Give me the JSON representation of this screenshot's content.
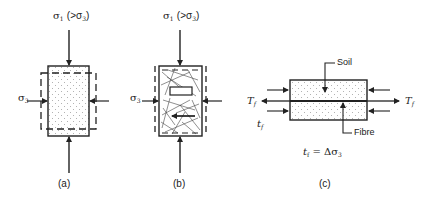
{
  "panels": {
    "a": {
      "caption": "(a)",
      "top_load_symbol": "σ",
      "top_load_sub": "1",
      "top_load_condition": "(>σ",
      "top_load_condition_sub": "3",
      "top_load_condition_close": ")",
      "side_load_symbol": "σ",
      "side_load_sub": "3"
    },
    "b": {
      "caption": "(b)",
      "top_load_symbol": "σ",
      "top_load_sub": "1",
      "top_load_condition": "(>σ",
      "top_load_condition_sub": "3",
      "top_load_condition_close": ")",
      "side_load_symbol": "σ",
      "side_load_sub": "3"
    },
    "c": {
      "caption": "(c)",
      "soil_label": "Soil",
      "fibre_label": "Fibre",
      "tension_symbol": "T",
      "tension_sub": "f",
      "shear_symbol": "t",
      "shear_sub": "f",
      "equation_lhs": "t",
      "equation_lhs_sub": "f",
      "equation_rhs": " = Δσ",
      "equation_rhs_sub": "3"
    }
  },
  "colors": {
    "stroke": "#222222",
    "stipple": "#9a9a9a",
    "background": "#ffffff"
  }
}
